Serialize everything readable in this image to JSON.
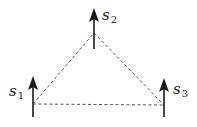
{
  "diagram": {
    "title": "",
    "nodes": [
      {
        "id": "s1",
        "symbol": "s",
        "subscript": "1",
        "x": 33,
        "base_y": 104,
        "arrow_top": 76,
        "arrow_bottom": 117
      },
      {
        "id": "s2",
        "symbol": "s",
        "subscript": "2",
        "x": 94,
        "base_y": 33,
        "arrow_top": 8,
        "arrow_bottom": 49
      },
      {
        "id": "s3",
        "symbol": "s",
        "subscript": "3",
        "x": 164,
        "base_y": 105,
        "arrow_top": 78,
        "arrow_bottom": 117
      }
    ],
    "edges": [
      {
        "from": "s1",
        "to": "s2",
        "style": "dashed"
      },
      {
        "from": "s2",
        "to": "s3",
        "style": "dashed"
      },
      {
        "from": "s1",
        "to": "s3",
        "style": "dashed"
      }
    ],
    "arrow_direction": "up",
    "colors": {
      "arrow": "#1a1a1a",
      "edge": "#555555",
      "background": "#ffffff"
    }
  }
}
